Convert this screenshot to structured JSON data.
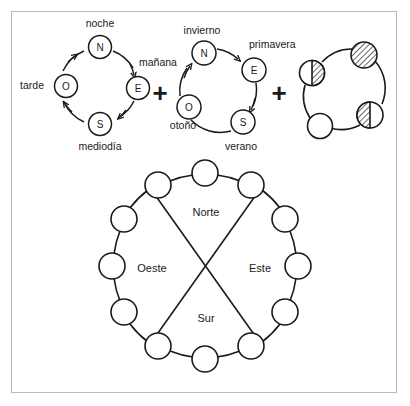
{
  "figure": {
    "background": "#ffffff",
    "ink": "#1a1a1a",
    "frame_color": "#b9b9b9"
  },
  "operators": [
    {
      "name": "plus-1",
      "symbol": "+",
      "x": 160,
      "y": 93
    },
    {
      "name": "plus-2",
      "symbol": "+",
      "x": 279,
      "y": 93
    }
  ],
  "diagrams": [
    {
      "id": "day-cycle",
      "name": "ciclo-del-dia",
      "center": {
        "cx": 98,
        "cy": 85
      },
      "radius": 40,
      "direction": "counterclockwise",
      "nodes": [
        {
          "key": "N",
          "label": "N",
          "position": "top",
          "cx": 100,
          "cy": 47
        },
        {
          "key": "E",
          "label": "E",
          "position": "right",
          "cx": 138,
          "cy": 88
        },
        {
          "key": "S",
          "label": "S",
          "position": "bottom",
          "cx": 100,
          "cy": 124
        },
        {
          "key": "O",
          "label": "O",
          "position": "left",
          "cx": 66,
          "cy": 86
        }
      ],
      "outer_labels": [
        {
          "key": "noche",
          "text": "noche",
          "x": 100,
          "y": 27,
          "anchor": "middle"
        },
        {
          "key": "manana",
          "text": "mañana",
          "x": 139,
          "y": 66,
          "anchor": "start"
        },
        {
          "key": "mediodia",
          "text": "mediodía",
          "x": 100,
          "y": 150,
          "anchor": "middle"
        },
        {
          "key": "tarde",
          "text": "tarde",
          "x": 44,
          "y": 89,
          "anchor": "end"
        }
      ]
    },
    {
      "id": "year-cycle",
      "name": "ciclo-del-ano",
      "center": {
        "cx": 216,
        "cy": 88
      },
      "radius": 41,
      "direction": "clockwise",
      "nodes": [
        {
          "key": "N",
          "label": "N",
          "position": "top-left",
          "cx": 204,
          "cy": 53
        },
        {
          "key": "E",
          "label": "E",
          "position": "upper-right",
          "cx": 254,
          "cy": 70
        },
        {
          "key": "S",
          "label": "S",
          "position": "lower-right",
          "cx": 243,
          "cy": 122
        },
        {
          "key": "O",
          "label": "O",
          "position": "lower-left",
          "cx": 189,
          "cy": 107
        }
      ],
      "outer_labels": [
        {
          "key": "invierno",
          "text": "invierno",
          "x": 202,
          "y": 34,
          "anchor": "middle"
        },
        {
          "key": "primavera",
          "text": "primavera",
          "x": 249,
          "y": 48,
          "anchor": "start"
        },
        {
          "key": "verano",
          "text": "verano",
          "x": 241,
          "y": 150,
          "anchor": "middle"
        },
        {
          "key": "otono",
          "text": "otoño",
          "x": 183,
          "y": 129,
          "anchor": "middle"
        }
      ]
    },
    {
      "id": "moon-cycle",
      "name": "ciclo-lunar",
      "center": {
        "cx": 345,
        "cy": 88
      },
      "radius": 41,
      "direction": "none",
      "nodes": [
        {
          "key": "luna-llena",
          "fill": "hatched",
          "cx": 364,
          "cy": 55
        },
        {
          "key": "cuarto-menguante",
          "fill": "half-right",
          "cx": 312,
          "cy": 73
        },
        {
          "key": "cuarto-creciente",
          "fill": "half-left",
          "cx": 370,
          "cy": 115
        },
        {
          "key": "luna-nueva",
          "fill": "empty",
          "cx": 320,
          "cy": 126
        }
      ],
      "outer_labels": []
    }
  ],
  "compass": {
    "id": "compass-rose",
    "name": "rosa-de-los-vientos",
    "center": {
      "cx": 205,
      "cy": 266
    },
    "radius": 93,
    "bead_radius": 13,
    "bead_count": 12,
    "cross_lines": 2,
    "quadrant_labels": [
      {
        "key": "norte",
        "text": "Norte",
        "x": 206,
        "y": 212
      },
      {
        "key": "este",
        "text": "Este",
        "x": 258,
        "y": 268
      },
      {
        "key": "sur",
        "text": "Sur",
        "x": 206,
        "y": 318
      },
      {
        "key": "oeste",
        "text": "Oeste",
        "x": 153,
        "y": 268
      }
    ],
    "beads": [
      {
        "index": 0,
        "angle_deg": -90,
        "cx": 205,
        "cy": 173
      },
      {
        "index": 1,
        "angle_deg": -60,
        "cx": 251,
        "cy": 185
      },
      {
        "index": 2,
        "angle_deg": -30,
        "cx": 285,
        "cy": 219
      },
      {
        "index": 3,
        "angle_deg": 0,
        "cx": 298,
        "cy": 266
      },
      {
        "index": 4,
        "angle_deg": 30,
        "cx": 285,
        "cy": 312
      },
      {
        "index": 5,
        "angle_deg": 60,
        "cx": 251,
        "cy": 346
      },
      {
        "index": 6,
        "angle_deg": 90,
        "cx": 205,
        "cy": 359
      },
      {
        "index": 7,
        "angle_deg": 120,
        "cx": 158,
        "cy": 346
      },
      {
        "index": 8,
        "angle_deg": 150,
        "cx": 124,
        "cy": 312
      },
      {
        "index": 9,
        "angle_deg": 180,
        "cx": 112,
        "cy": 266
      },
      {
        "index": 10,
        "angle_deg": 210,
        "cx": 124,
        "cy": 219
      },
      {
        "index": 11,
        "angle_deg": 240,
        "cx": 158,
        "cy": 185
      }
    ]
  }
}
